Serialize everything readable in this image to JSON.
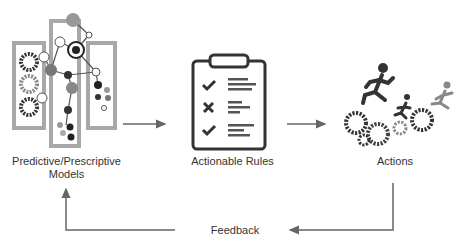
{
  "diagram": {
    "nodes": [
      {
        "id": "models",
        "label_line1": "Predictive/Prescriptive",
        "label_line2": "Models",
        "icon": "network-graph-icon"
      },
      {
        "id": "rules",
        "label": "Actionable Rules",
        "icon": "clipboard-checklist-icon"
      },
      {
        "id": "actions",
        "label": "Actions",
        "icon": "runners-gears-icon"
      }
    ],
    "edges": [
      {
        "from": "models",
        "to": "rules"
      },
      {
        "from": "rules",
        "to": "actions"
      },
      {
        "from": "actions",
        "to": "models",
        "label": "Feedback"
      }
    ],
    "colors": {
      "arrow": "#666666",
      "text": "#333333",
      "box": "#a0a0a0"
    }
  }
}
